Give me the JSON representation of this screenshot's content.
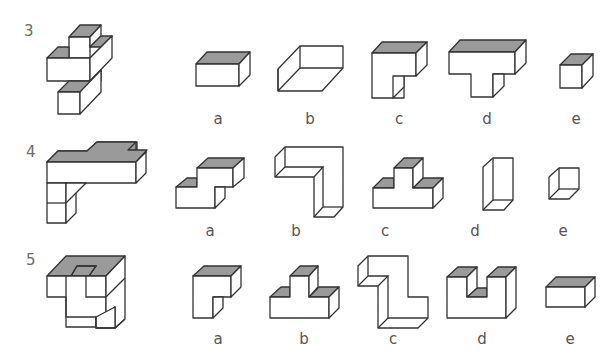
{
  "puzzle": {
    "rows": [
      {
        "number": "3",
        "options": [
          {
            "label": "a",
            "shape": "flat box with shaded top"
          },
          {
            "label": "b",
            "shape": "open tray / rhombus prism (no shading)"
          },
          {
            "label": "c",
            "shape": "L-shaped block with shaded top"
          },
          {
            "label": "d",
            "shape": "T-shaped block with shaded top"
          },
          {
            "label": "e",
            "shape": "small cube with shaded top"
          }
        ]
      },
      {
        "number": "4",
        "options": [
          {
            "label": "a",
            "shape": "step / Z-shaped block with shaded tops"
          },
          {
            "label": "b",
            "shape": "inverted L hollow shape (no shading)"
          },
          {
            "label": "c",
            "shape": "stepped pyramid block with three shaded tops"
          },
          {
            "label": "d",
            "shape": "tall column (no shading)"
          },
          {
            "label": "e",
            "shape": "small open cube (no shading)"
          }
        ]
      },
      {
        "number": "5",
        "options": [
          {
            "label": "a",
            "shape": "L-shaped block with shaded top"
          },
          {
            "label": "b",
            "shape": "stepped pyramid block with three shaded tops"
          },
          {
            "label": "c",
            "shape": "S/Z-shaped tall hollow shape (no shading)"
          },
          {
            "label": "d",
            "shape": "U-shaped block with shaded tops"
          },
          {
            "label": "e",
            "shape": "flat box with shaded top"
          }
        ]
      }
    ]
  },
  "colors": {
    "stroke": "#333333",
    "shade": "#9a9a9a",
    "face": "#ffffff",
    "label": "#555555"
  }
}
